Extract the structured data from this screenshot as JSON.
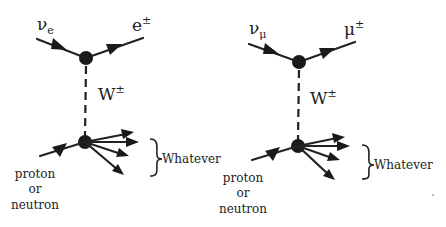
{
  "diagrams": [
    {
      "id": "electron",
      "incoming_lepton": {
        "symbol": "ν",
        "subscript": "e"
      },
      "outgoing_lepton": {
        "symbol": "e",
        "superscript": "±"
      },
      "boson": {
        "symbol": "W",
        "superscript": "±"
      },
      "hadron_label": [
        "proton",
        "or",
        "neutron"
      ],
      "products_label": "Whatever"
    },
    {
      "id": "muon",
      "incoming_lepton": {
        "symbol": "ν",
        "subscript": "μ"
      },
      "outgoing_lepton": {
        "symbol": "μ",
        "superscript": "±"
      },
      "boson": {
        "symbol": "W",
        "superscript": "±"
      },
      "hadron_label": [
        "proton",
        "or",
        "neutron"
      ],
      "products_label": "Whatever"
    }
  ],
  "colors": {
    "ink": "#222222",
    "background": "#ffffff"
  }
}
